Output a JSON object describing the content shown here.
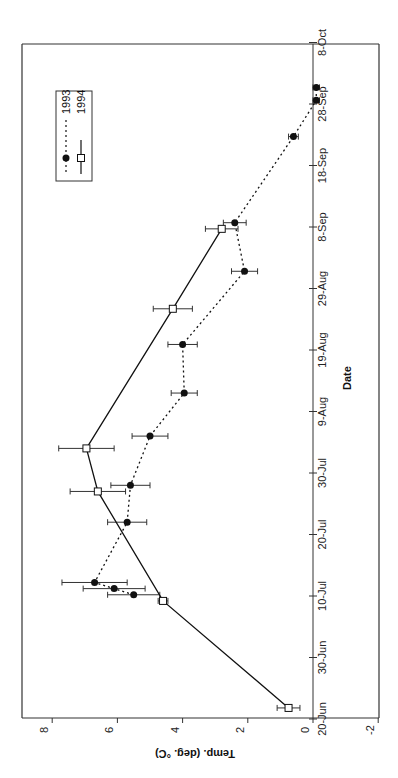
{
  "chart_data": {
    "type": "line",
    "orientation": "rotated 90deg counter-clockwise",
    "title": "",
    "xlabel": "Date",
    "ylabel": "Temp. (deg. °C)",
    "x_ticks": [
      "20-Jun",
      "30-Jun",
      "10-Jul",
      "20-Jul",
      "30-Jul",
      "9-Aug",
      "19-Aug",
      "29-Aug",
      "8-Sep",
      "18-Sep",
      "28-Sep",
      "8-Oct"
    ],
    "y_ticks": [
      "8",
      "6",
      "4",
      "2",
      "0",
      "-2"
    ],
    "ylim": [
      -2,
      9
    ],
    "xlim": [
      "20-Jun",
      "8-Oct"
    ],
    "grid": false,
    "legend_position": "upper right (rotated: top-left of image)",
    "annotations": [
      {
        "text": "4",
        "date": "25-Aug",
        "temp": 3.9
      }
    ],
    "series": [
      {
        "name": "1993",
        "style": "dotted line, filled circle markers",
        "points": [
          {
            "date": "10-Jul",
            "day": 20.2,
            "temp": 5.5,
            "err": 0.8
          },
          {
            "date": "11-Jul",
            "day": 21.2,
            "temp": 6.1,
            "err": 0.95
          },
          {
            "date": "12-Jul",
            "day": 22.2,
            "temp": 6.7,
            "err": 1.0
          },
          {
            "date": "22-Jul",
            "day": 32.0,
            "temp": 5.7,
            "err": 0.6
          },
          {
            "date": "28-Jul",
            "day": 38.0,
            "temp": 5.6,
            "err": 0.6
          },
          {
            "date": "5-Aug",
            "day": 46.0,
            "temp": 5.0,
            "err": 0.55
          },
          {
            "date": "12-Aug",
            "day": 53.0,
            "temp": 3.95,
            "err": 0.4
          },
          {
            "date": "19-Aug",
            "day": 60.9,
            "temp": 4.0,
            "err": 0.45
          },
          {
            "date": "31-Aug",
            "day": 72.8,
            "temp": 2.1,
            "err": 0.4
          },
          {
            "date": "9-Sep",
            "day": 80.7,
            "temp": 2.4,
            "err": 0.35
          },
          {
            "date": "22-Sep",
            "day": 94.7,
            "temp": 0.6,
            "err": 0.15
          },
          {
            "date": "28-Sep",
            "day": 100.6,
            "temp": -0.1,
            "err": 0.1
          },
          {
            "date": "30-Sep",
            "day": 102.7,
            "temp": -0.1,
            "err": 0.1
          }
        ]
      },
      {
        "name": "1994",
        "style": "solid line, open square markers",
        "points": [
          {
            "date": "22-Jun",
            "day": 1.8,
            "temp": 0.75,
            "err": 0.35
          },
          {
            "date": "9-Jul",
            "day": 19.2,
            "temp": 4.6,
            "err": 0.15
          },
          {
            "date": "27-Jul",
            "day": 37.0,
            "temp": 6.6,
            "err": 0.85
          },
          {
            "date": "3-Aug",
            "day": 44.0,
            "temp": 6.95,
            "err": 0.85
          },
          {
            "date": "25-Aug",
            "day": 66.7,
            "temp": 4.3,
            "err": 0.6
          },
          {
            "date": "8-Sep",
            "day": 79.7,
            "temp": 2.8,
            "err": 0.5
          }
        ]
      }
    ]
  },
  "axes": {
    "x_title": "Date",
    "y_title": "Temp. (deg. °C)"
  },
  "legend": {
    "items": [
      {
        "label": "1993"
      },
      {
        "label": "1994"
      }
    ]
  },
  "colors": {
    "line": "#111111",
    "frame": "#333333",
    "background": "#ffffff"
  }
}
